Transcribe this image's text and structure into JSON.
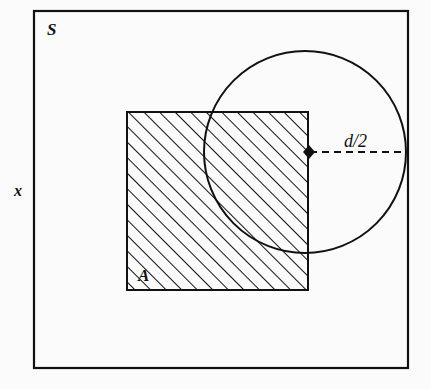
{
  "figure": {
    "kind": "set-diagram",
    "background_color": "#fbfbfb",
    "stroke_color": "#111111",
    "labels": {
      "sample_space": "S",
      "region": "A",
      "radius": "d/2",
      "axis": "x"
    },
    "elements": {
      "outer_rectangle": {
        "name": "sample-space-rectangle",
        "x": 34,
        "y": 11,
        "width": 374,
        "height": 357,
        "stroke_width": 2.2,
        "fill": "none"
      },
      "hatched_square": {
        "name": "region-a-square",
        "x": 127,
        "y": 112,
        "width": 181,
        "height": 178,
        "stroke_width": 2.0,
        "hatch_angle_deg": 45,
        "hatch_spacing": 11,
        "hatch_stroke_width": 2.0
      },
      "circle": {
        "name": "tolerance-circle",
        "cx": 305,
        "cy": 152,
        "r": 101,
        "stroke_width": 2.0,
        "fill": "none"
      },
      "center_marker": {
        "name": "circle-center-marker",
        "cx": 309,
        "cy": 152,
        "half_width": 6,
        "half_height": 7,
        "shape": "diamond",
        "fill": "#111111"
      },
      "radius_line": {
        "name": "radius-dashed-line",
        "x1": 310,
        "y1": 152,
        "x2": 405,
        "y2": 152,
        "stroke_width": 2.0,
        "dash": "7 5"
      }
    },
    "label_positions": {
      "sample_space": {
        "x": 47,
        "y": 35,
        "size": 17
      },
      "region": {
        "x": 138,
        "y": 281,
        "size": 17
      },
      "radius": {
        "x": 344,
        "y": 147,
        "size": 17
      },
      "axis": {
        "x": 14,
        "y": 196,
        "size": 16
      }
    }
  }
}
